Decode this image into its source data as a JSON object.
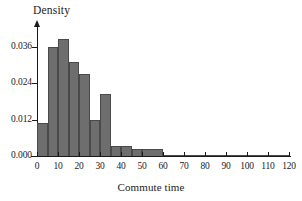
{
  "chart_data": {
    "type": "bar",
    "title": "",
    "xlabel": "Commute time",
    "ylabel": "Density",
    "xlim": [
      0,
      120
    ],
    "ylim": [
      0.0,
      0.042
    ],
    "grid": false,
    "legend": null,
    "xticks": [
      "0",
      "10",
      "20",
      "30",
      "40",
      "50",
      "60",
      "70",
      "80",
      "90",
      "100",
      "110",
      "120"
    ],
    "xtick_values": [
      0,
      10,
      20,
      30,
      40,
      50,
      60,
      70,
      80,
      90,
      100,
      110,
      120
    ],
    "yticks": [
      "0.000",
      "0.012",
      "0.024",
      "0.036"
    ],
    "ytick_values": [
      0.0,
      0.012,
      0.024,
      0.036
    ],
    "bin_edges": [
      0,
      5,
      10,
      15,
      20,
      25,
      30,
      35,
      40,
      45,
      50,
      60,
      70,
      80,
      90,
      100,
      110,
      120
    ],
    "categories": [
      "0-5",
      "5-10",
      "10-15",
      "15-20",
      "20-25",
      "25-30",
      "30-35",
      "35-40",
      "40-45",
      "45-50",
      "50-60",
      "60-70",
      "70-80",
      "80-90",
      "90-100",
      "100-110",
      "110-120"
    ],
    "values": [
      0.011,
      0.036,
      0.0385,
      0.031,
      0.027,
      0.0118,
      0.0205,
      0.0032,
      0.0032,
      0.0022,
      0.0022,
      0.0003,
      0.0003,
      0.0003,
      0.0003,
      0.0003,
      0.0003
    ],
    "bar_fill_color": "#6e6e6e",
    "bar_edge_color": "#4a4a4a",
    "axis_color": "#1a1a1a"
  }
}
